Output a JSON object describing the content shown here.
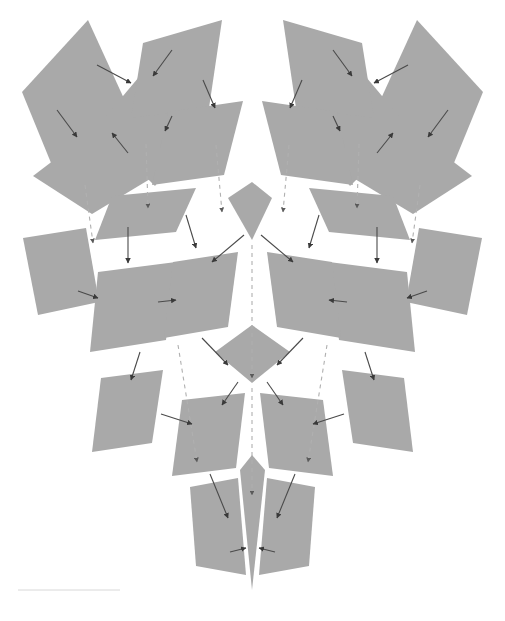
{
  "figure": {
    "kind": "node-link-diagram",
    "title": "",
    "width": 505,
    "height": 621,
    "background_color": "#ffffff",
    "has_text_labels": false,
    "symmetry": "mirror about vertical center axis (x = 252.5)"
  },
  "style": {
    "node_fill": "#a9a9a9",
    "node_fill_light": "#b4b4b4",
    "solid_edge_color": "#4a4a4a",
    "solid_edge_width": 1.1,
    "dashed_edge_color": "#b0b0b0",
    "dashed_edge_width": 1.1,
    "dash_pattern": "4 4",
    "arrowhead_color": "#3a3a3a",
    "arrowhead_size": 5,
    "rule_color": "#d8d8d8",
    "rule_width": 1
  },
  "nodes": [
    {
      "id": "n01",
      "row": 1,
      "side": "left",
      "points": "22,92 88,20 126,103 58,180"
    },
    {
      "id": "n02",
      "row": 1,
      "side": "left",
      "points": "96,128 155,58 212,110 155,186"
    },
    {
      "id": "n03",
      "row": 1,
      "side": "left",
      "points": "143,43 222,20 209,108 131,118"
    },
    {
      "id": "n04",
      "row": 2,
      "side": "left",
      "points": "33,176 100,125 160,173 92,214"
    },
    {
      "id": "n05",
      "row": 2,
      "side": "left",
      "points": "168,112 243,101 224,175 152,185"
    },
    {
      "id": "n06",
      "row": 2,
      "side": "left",
      "points": "112,196 196,188 176,232 95,240"
    },
    {
      "id": "n07",
      "row": 3,
      "side": "left",
      "points": "23,238 86,228 99,302 38,315"
    },
    {
      "id": "n08",
      "row": 3,
      "side": "left",
      "points": "98,272 176,262 166,340 90,352"
    },
    {
      "id": "n09",
      "row": 3,
      "side": "left",
      "points": "173,262 238,252 228,327 164,338"
    },
    {
      "id": "n10",
      "row": 4,
      "side": "left",
      "points": "101,378 163,370 152,443 92,452"
    },
    {
      "id": "n11",
      "row": 4,
      "side": "left",
      "points": "182,400 245,393 236,468 172,476"
    },
    {
      "id": "n12",
      "row": 5,
      "side": "left",
      "points": "190,487 238,478 246,575 196,566"
    },
    {
      "id": "n13",
      "row": 1,
      "side": "center",
      "points": "228,198 252,182 272,198 252,240"
    },
    {
      "id": "n14",
      "row": 3,
      "side": "center",
      "points": "215,352 252,325 290,352 252,383"
    },
    {
      "id": "n15",
      "row": 5,
      "side": "center",
      "points": "240,470 252,455 265,470 252,590"
    },
    {
      "id": "n16",
      "row": 1,
      "side": "right",
      "points": "483,92 417,20 379,103 447,180"
    },
    {
      "id": "n17",
      "row": 1,
      "side": "right",
      "points": "409,128 350,58 293,110 350,186"
    },
    {
      "id": "n18",
      "row": 1,
      "side": "right",
      "points": "362,43 283,20 296,108 374,118"
    },
    {
      "id": "n19",
      "row": 2,
      "side": "right",
      "points": "472,176 405,125 345,173 413,214"
    },
    {
      "id": "n20",
      "row": 2,
      "side": "right",
      "points": "337,112 262,101 281,175 353,185"
    },
    {
      "id": "n21",
      "row": 2,
      "side": "right",
      "points": "393,196 309,188 329,232 410,240"
    },
    {
      "id": "n22",
      "row": 3,
      "side": "right",
      "points": "482,238 419,228 406,302 467,315"
    },
    {
      "id": "n23",
      "row": 3,
      "side": "right",
      "points": "407,272 329,262 339,340 415,352"
    },
    {
      "id": "n24",
      "row": 3,
      "side": "right",
      "points": "332,262 267,252 277,327 341,338"
    },
    {
      "id": "n25",
      "row": 4,
      "side": "right",
      "points": "404,378 342,370 353,443 413,452"
    },
    {
      "id": "n26",
      "row": 4,
      "side": "right",
      "points": "323,400 260,393 269,468 333,476"
    },
    {
      "id": "n27",
      "row": 5,
      "side": "right",
      "points": "315,487 267,478 259,575 309,566"
    }
  ],
  "edges": [
    {
      "id": "e01",
      "from": "n01",
      "to": "n02",
      "type": "solid",
      "path": "M 97,65 L 131,83"
    },
    {
      "id": "e02",
      "from": "n03",
      "to": "n02",
      "type": "solid",
      "path": "M 172,50 L 153,76"
    },
    {
      "id": "e03",
      "from": "n01",
      "to": "n04",
      "type": "solid",
      "path": "M 57,110 L 77,137"
    },
    {
      "id": "e04",
      "from": "n02",
      "to": "n04",
      "type": "solid",
      "path": "M 128,153 L 112,133"
    },
    {
      "id": "e05",
      "from": "n03",
      "to": "n05",
      "type": "solid",
      "path": "M 203,80 L 215,108"
    },
    {
      "id": "e06",
      "from": "n02",
      "to": "n05",
      "type": "solid",
      "path": "M 172,116 L 165,131"
    },
    {
      "id": "e07",
      "from": "n04",
      "to": "n06",
      "type": "dashed",
      "path": "M 85,185 L 93,243"
    },
    {
      "id": "e08",
      "from": "n05",
      "to": "n06",
      "type": "dashed",
      "path": "M 146,144 L 148,208"
    },
    {
      "id": "e09",
      "from": "n05",
      "to": "n13",
      "type": "dashed",
      "path": "M 216,145 L 222,212"
    },
    {
      "id": "e10",
      "from": "n06",
      "to": "n08",
      "type": "solid",
      "path": "M 128,227 L 128,263"
    },
    {
      "id": "e11",
      "from": "n07",
      "to": "n08",
      "type": "solid",
      "path": "M 78,291 L 98,298"
    },
    {
      "id": "e12",
      "from": "n06",
      "to": "n09",
      "type": "solid",
      "path": "M 186,215 L 196,248"
    },
    {
      "id": "e13",
      "from": "n08",
      "to": "n09",
      "type": "solid",
      "path": "M 158,302 L 176,300"
    },
    {
      "id": "e14",
      "from": "n13",
      "to": "n09",
      "type": "solid",
      "path": "M 244,235 L 212,262"
    },
    {
      "id": "e15",
      "from": "n08",
      "to": "n10",
      "type": "solid",
      "path": "M 140,352 L 131,380"
    },
    {
      "id": "e16",
      "from": "n09",
      "to": "n14",
      "type": "solid",
      "path": "M 202,338 L 228,365"
    },
    {
      "id": "e17",
      "from": "n13",
      "to": "n14",
      "type": "dashed",
      "path": "M 252,245 L 252,378"
    },
    {
      "id": "e18",
      "from": "n09",
      "to": "n11",
      "type": "dashed",
      "path": "M 178,345 L 197,462"
    },
    {
      "id": "e19",
      "from": "n10",
      "to": "n11",
      "type": "solid",
      "path": "M 161,414 L 192,424"
    },
    {
      "id": "e20",
      "from": "n14",
      "to": "n11",
      "type": "solid",
      "path": "M 238,382 L 222,405"
    },
    {
      "id": "e21",
      "from": "n14",
      "to": "n15",
      "type": "dashed",
      "path": "M 252,388 L 252,495"
    },
    {
      "id": "e22",
      "from": "n11",
      "to": "n12",
      "type": "solid",
      "path": "M 210,474 L 228,518"
    },
    {
      "id": "e23",
      "from": "n12",
      "to": "n15",
      "type": "solid",
      "path": "M 230,552 L 246,548"
    },
    {
      "id": "e24",
      "from": "n16",
      "to": "n17",
      "type": "solid",
      "path": "M 408,65 L 374,83"
    },
    {
      "id": "e25",
      "from": "n18",
      "to": "n17",
      "type": "solid",
      "path": "M 333,50 L 352,76"
    },
    {
      "id": "e26",
      "from": "n16",
      "to": "n19",
      "type": "solid",
      "path": "M 448,110 L 428,137"
    },
    {
      "id": "e27",
      "from": "n17",
      "to": "n19",
      "type": "solid",
      "path": "M 377,153 L 393,133"
    },
    {
      "id": "e28",
      "from": "n18",
      "to": "n20",
      "type": "solid",
      "path": "M 302,80 L 290,108"
    },
    {
      "id": "e29",
      "from": "n17",
      "to": "n20",
      "type": "solid",
      "path": "M 333,116 L 340,131"
    },
    {
      "id": "e30",
      "from": "n19",
      "to": "n21",
      "type": "dashed",
      "path": "M 420,185 L 412,243"
    },
    {
      "id": "e31",
      "from": "n20",
      "to": "n21",
      "type": "dashed",
      "path": "M 359,144 L 357,208"
    },
    {
      "id": "e32",
      "from": "n20",
      "to": "n13",
      "type": "dashed",
      "path": "M 289,145 L 283,212"
    },
    {
      "id": "e33",
      "from": "n21",
      "to": "n23",
      "type": "solid",
      "path": "M 377,227 L 377,263"
    },
    {
      "id": "e34",
      "from": "n22",
      "to": "n23",
      "type": "solid",
      "path": "M 427,291 L 407,298"
    },
    {
      "id": "e35",
      "from": "n21",
      "to": "n24",
      "type": "solid",
      "path": "M 319,215 L 309,248"
    },
    {
      "id": "e36",
      "from": "n23",
      "to": "n24",
      "type": "solid",
      "path": "M 347,302 L 329,300"
    },
    {
      "id": "e37",
      "from": "n13",
      "to": "n24",
      "type": "solid",
      "path": "M 261,235 L 293,262"
    },
    {
      "id": "e38",
      "from": "n23",
      "to": "n25",
      "type": "solid",
      "path": "M 365,352 L 374,380"
    },
    {
      "id": "e39",
      "from": "n24",
      "to": "n14",
      "type": "solid",
      "path": "M 303,338 L 277,365"
    },
    {
      "id": "e40",
      "from": "n24",
      "to": "n26",
      "type": "dashed",
      "path": "M 327,345 L 308,462"
    },
    {
      "id": "e41",
      "from": "n25",
      "to": "n26",
      "type": "solid",
      "path": "M 344,414 L 313,424"
    },
    {
      "id": "e42",
      "from": "n14",
      "to": "n26",
      "type": "solid",
      "path": "M 267,382 L 283,405"
    },
    {
      "id": "e43",
      "from": "n26",
      "to": "n27",
      "type": "solid",
      "path": "M 295,474 L 277,518"
    },
    {
      "id": "e44",
      "from": "n27",
      "to": "n15",
      "type": "solid",
      "path": "M 275,552 L 259,548"
    }
  ],
  "rules": [
    {
      "id": "r1",
      "x1": 18,
      "y1": 590,
      "x2": 120,
      "y2": 590
    }
  ],
  "legend": {
    "solid_edge_meaning": "",
    "dashed_edge_meaning": ""
  }
}
